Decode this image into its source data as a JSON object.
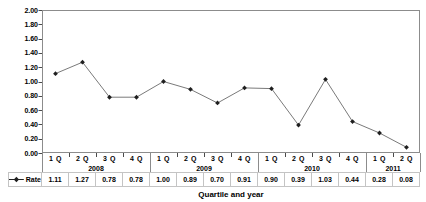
{
  "chart_data": {
    "type": "line",
    "title": "",
    "xlabel": "Quartile and year",
    "ylabel": "",
    "ylim": [
      0.0,
      2.0
    ],
    "ytick_step": 0.2,
    "ytick_labels": [
      "0.00",
      "0.20",
      "0.40",
      "0.60",
      "0.80",
      "1.00",
      "1.20",
      "1.40",
      "1.60",
      "1.80",
      "2.00"
    ],
    "grid": false,
    "legend_label": "Rate",
    "legend_position": "bottom-left-table",
    "categories": [
      "1 Q",
      "2 Q",
      "3 Q",
      "4 Q",
      "1 Q",
      "2 Q",
      "3 Q",
      "4 Q",
      "1 Q",
      "2 Q",
      "3 Q",
      "4 Q",
      "1 Q",
      "2 Q"
    ],
    "year_groups": [
      {
        "label": "2008",
        "span": 4
      },
      {
        "label": "2009",
        "span": 4
      },
      {
        "label": "2010",
        "span": 4
      },
      {
        "label": "2011",
        "span": 2
      }
    ],
    "series": [
      {
        "name": "Rate",
        "values": [
          1.11,
          1.27,
          0.78,
          0.78,
          1.0,
          0.89,
          0.7,
          0.91,
          0.9,
          0.39,
          1.03,
          0.44,
          0.28,
          0.08
        ]
      }
    ],
    "value_labels": [
      "1.11",
      "1.27",
      "0.78",
      "0.78",
      "1.00",
      "0.89",
      "0.70",
      "0.91",
      "0.90",
      "0.39",
      "1.03",
      "0.44",
      "0.28",
      "0.08"
    ]
  },
  "colors": {
    "background": "#ffffff",
    "plot_border": "#8c8c8c",
    "axis_tick": "#4a4a4a",
    "series_line": "#7a7a7a",
    "marker": "#1f1f1f",
    "table_border": "#c4c4c4",
    "text": "#000000"
  }
}
